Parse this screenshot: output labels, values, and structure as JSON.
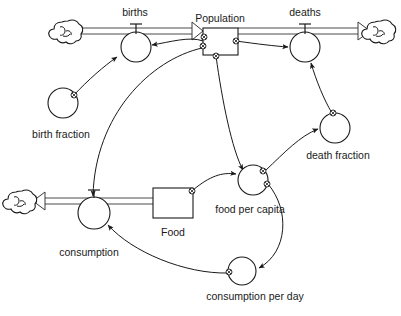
{
  "diagram": {
    "background_color": "#ffffff",
    "line_color": "#1a1a1a",
    "width": 401,
    "height": 316,
    "stocks": [
      {
        "id": "population",
        "label": "Population",
        "x": 203,
        "y": 28,
        "w": 35,
        "h": 27,
        "label_x": 220,
        "label_y": 22
      },
      {
        "id": "food",
        "label": "Food",
        "x": 153,
        "y": 188,
        "w": 40,
        "h": 30,
        "label_x": 173,
        "label_y": 236
      }
    ],
    "flows": [
      {
        "id": "births",
        "label": "births",
        "cx": 136,
        "cy": 47,
        "r": 15,
        "label_x": 135,
        "label_y": 16
      },
      {
        "id": "deaths",
        "label": "deaths",
        "cx": 305,
        "cy": 47,
        "r": 15,
        "label_x": 305,
        "label_y": 16
      },
      {
        "id": "consumption",
        "label": "consumption",
        "cx": 94,
        "cy": 213,
        "r": 16,
        "label_x": 89,
        "label_y": 256
      }
    ],
    "auxiliaries": [
      {
        "id": "birth-fraction",
        "label": "birth fraction",
        "cx": 63,
        "cy": 103,
        "r": 15,
        "label_x": 61,
        "label_y": 138
      },
      {
        "id": "death-fraction",
        "label": "death fraction",
        "cx": 335,
        "cy": 128,
        "r": 15,
        "label_x": 338,
        "label_y": 159
      },
      {
        "id": "food-per-capita",
        "label": "food per capita",
        "cx": 253,
        "cy": 180,
        "r": 15,
        "label_x": 250,
        "label_y": 213
      },
      {
        "id": "consumption-per-day",
        "label": "consumption per day",
        "cx": 242,
        "cy": 271,
        "r": 14,
        "label_x": 255,
        "label_y": 300
      }
    ],
    "clouds": [
      {
        "id": "cloud-births-source",
        "cx": 68,
        "cy": 31
      },
      {
        "id": "cloud-deaths-sink",
        "cx": 381,
        "cy": 31
      },
      {
        "id": "cloud-consumption-sink",
        "cx": 22,
        "cy": 201
      }
    ],
    "connector_labels": {
      "births_inflow": "births inflow pipe",
      "deaths_outflow": "deaths outflow pipe",
      "consumption_outflow": "consumption outflow pipe"
    }
  }
}
